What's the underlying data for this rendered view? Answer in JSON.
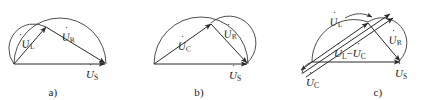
{
  "figure": {
    "title": "",
    "background_color": "#ffffff",
    "stroke_color": "#2a2a2a",
    "width": 434,
    "height": 100
  },
  "panels": [
    {
      "id": "a",
      "caption": "a)",
      "description": "Phasor diagram of a series R-L circuit: U_L leads, U_R, resultant U_S along horizontal axis, inscribed in a semicircular arc.",
      "labels": [
        {
          "name": "u-l",
          "symbol": "U",
          "dot": true,
          "subscript": "L",
          "text": "U̇L"
        },
        {
          "name": "u-r",
          "symbol": "U",
          "dot": true,
          "subscript": "R",
          "text": "U̇R"
        },
        {
          "name": "u-s",
          "symbol": "U",
          "dot": true,
          "subscript": "S",
          "text": "U̇S"
        }
      ]
    },
    {
      "id": "b",
      "caption": "b)",
      "description": "Phasor diagram of a series R-C circuit: U_C long diagonal, U_R short right leg, resultant U_S along horizontal axis, inscribed in a semicircular arc.",
      "labels": [
        {
          "name": "u-c",
          "symbol": "U",
          "dot": true,
          "subscript": "C",
          "text": "U̇C"
        },
        {
          "name": "u-r",
          "symbol": "U",
          "dot": true,
          "subscript": "R",
          "text": "U̇R"
        },
        {
          "name": "u-s",
          "symbol": "U",
          "dot": true,
          "subscript": "S",
          "text": "U̇S"
        }
      ]
    },
    {
      "id": "c",
      "caption": "c)",
      "description": "Phasor diagram of a series R-L-C circuit: U_L upward-right long phasor, U_C downward-left phasor, their difference U_L - U_C, U_R, and resultant U_S along the horizontal axis.",
      "labels": [
        {
          "name": "u-l",
          "symbol": "U",
          "dot": true,
          "subscript": "L",
          "text": "U̇L"
        },
        {
          "name": "u-c",
          "symbol": "U",
          "dot": true,
          "subscript": "C",
          "text": "U̇C"
        },
        {
          "name": "u-l-minus-u-c",
          "symbol": "U",
          "dot": true,
          "subscript": "L",
          "operator": "−",
          "symbol2": "U",
          "subscript2": "C",
          "text": "U̇L − U̇C"
        },
        {
          "name": "u-r",
          "symbol": "U",
          "dot": true,
          "subscript": "R",
          "text": "U̇R"
        },
        {
          "name": "u-s",
          "symbol": "U",
          "dot": true,
          "subscript": "S",
          "text": "U̇S"
        }
      ]
    }
  ],
  "label_text": {
    "a": {
      "ul": "U",
      "ul_sub": "L",
      "ur": "U",
      "ur_sub": "R",
      "us": "U",
      "us_sub": "S"
    },
    "b": {
      "uc": "U",
      "uc_sub": "C",
      "ur": "U",
      "ur_sub": "R",
      "us": "U",
      "us_sub": "S"
    },
    "c": {
      "ul": "U",
      "ul_sub": "L",
      "uc": "U",
      "uc_sub": "C",
      "diff_u1": "U",
      "diff_sub1": "L",
      "diff_op": "−",
      "diff_u2": "U",
      "diff_sub2": "C",
      "ur": "U",
      "ur_sub": "R",
      "us": "U",
      "us_sub": "S"
    }
  },
  "captions": {
    "a": "a)",
    "b": "b)",
    "c": "c)"
  }
}
